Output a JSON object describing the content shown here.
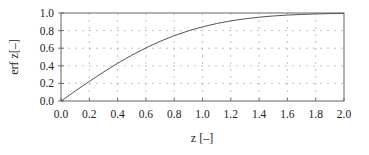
{
  "chart_data": {
    "type": "line",
    "title": "",
    "xlabel": "z [–]",
    "ylabel": "erf z[–]",
    "xlim": [
      0.0,
      2.0
    ],
    "ylim": [
      0.0,
      1.0
    ],
    "grid": true,
    "grid_style": "dashed",
    "legend": null,
    "x_ticks": [
      "0.0",
      "0.2",
      "0.4",
      "0.6",
      "0.8",
      "1.0",
      "1.2",
      "1.4",
      "1.6",
      "1.8",
      "2.0"
    ],
    "y_ticks": [
      "0.0",
      "0.2",
      "0.4",
      "0.6",
      "0.8",
      "1.0"
    ],
    "series": [
      {
        "name": "erf z",
        "color": "#555555",
        "x": [
          0.0,
          0.1,
          0.2,
          0.3,
          0.4,
          0.5,
          0.6,
          0.7,
          0.8,
          0.9,
          1.0,
          1.1,
          1.2,
          1.3,
          1.4,
          1.5,
          1.6,
          1.7,
          1.8,
          1.9,
          2.0
        ],
        "y": [
          0.0,
          0.1125,
          0.2227,
          0.3286,
          0.4284,
          0.5205,
          0.6039,
          0.6778,
          0.7421,
          0.7969,
          0.8427,
          0.8802,
          0.9103,
          0.934,
          0.9523,
          0.9661,
          0.9763,
          0.9838,
          0.9891,
          0.9928,
          0.9953
        ]
      }
    ]
  },
  "colors": {
    "axis": "#555555",
    "grid": "#9a9a9a",
    "curve": "#555555",
    "text": "#222222"
  }
}
